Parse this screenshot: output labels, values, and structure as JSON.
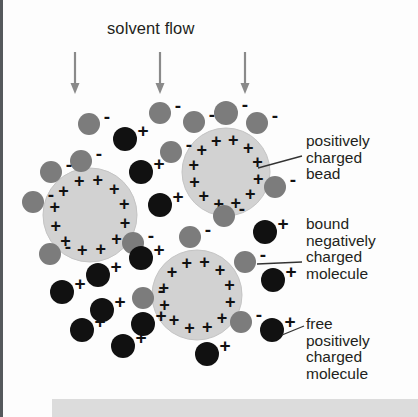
{
  "figure": {
    "type": "ion-exchange-chromatography-bead-diagram",
    "solvent_label": "solvent flow",
    "background_color": "#fdfdfd",
    "bottom_bar_color": "#dcdcdc",
    "left_rule_color": "#55595c"
  },
  "captions": {
    "bead": "positively\ncharged\nbead",
    "bound_molecule": "bound\nnegatively\ncharged\nmolecule",
    "free_molecule": "free\npositively\ncharged\nmolecule"
  },
  "legend_colors": {
    "bead_fill": "#d2d2d2",
    "bead_stroke": "#c4c4c4",
    "negative_particle": "#7c7c7c",
    "positive_particle": "#111111",
    "arrow": "#8a8a8a",
    "sign_color": "#111111",
    "leader_line": "#333333"
  },
  "arrows": [
    {
      "x": 75,
      "y1": 52,
      "y2": 92
    },
    {
      "x": 160,
      "y1": 52,
      "y2": 92
    },
    {
      "x": 245,
      "y1": 52,
      "y2": 92
    }
  ],
  "beads": [
    {
      "id": "bead-left",
      "cx": 90,
      "cy": 215,
      "r": 47,
      "charge": "+",
      "plus_count": 12
    },
    {
      "id": "bead-upper-right",
      "cx": 226,
      "cy": 172,
      "r": 44,
      "charge": "+",
      "plus_count": 12
    },
    {
      "id": "bead-lower-middle",
      "cx": 197,
      "cy": 295,
      "r": 45,
      "charge": "+",
      "plus_count": 12
    }
  ],
  "negative_particles": [
    {
      "cx": 89,
      "cy": 124,
      "r": 11,
      "sign": "-"
    },
    {
      "cx": 160,
      "cy": 113,
      "r": 11,
      "sign": "-"
    },
    {
      "cx": 194,
      "cy": 122,
      "r": 11,
      "sign": "-"
    },
    {
      "cx": 226,
      "cy": 113,
      "r": 12,
      "sign": "-"
    },
    {
      "cx": 257,
      "cy": 123,
      "r": 11,
      "sign": "-"
    },
    {
      "cx": 81,
      "cy": 161,
      "r": 11,
      "sign": "-"
    },
    {
      "cx": 51,
      "cy": 172,
      "r": 11,
      "sign": "-"
    },
    {
      "cx": 171,
      "cy": 152,
      "r": 11,
      "sign": "-"
    },
    {
      "cx": 33,
      "cy": 202,
      "r": 11,
      "sign": "-"
    },
    {
      "cx": 275,
      "cy": 187,
      "r": 11,
      "sign": "-"
    },
    {
      "cx": 224,
      "cy": 216,
      "r": 11,
      "sign": "-"
    },
    {
      "cx": 50,
      "cy": 254,
      "r": 11,
      "sign": "-"
    },
    {
      "cx": 133,
      "cy": 243,
      "r": 11,
      "sign": "-"
    },
    {
      "cx": 190,
      "cy": 237,
      "r": 11,
      "sign": "-"
    },
    {
      "cx": 245,
      "cy": 262,
      "r": 11,
      "sign": "-"
    },
    {
      "cx": 143,
      "cy": 298,
      "r": 11,
      "sign": "-"
    },
    {
      "cx": 241,
      "cy": 322,
      "r": 11,
      "sign": "-"
    }
  ],
  "positive_particles": [
    {
      "cx": 125,
      "cy": 139,
      "r": 12,
      "sign": "+"
    },
    {
      "cx": 141,
      "cy": 172,
      "r": 12,
      "sign": "+"
    },
    {
      "cx": 160,
      "cy": 205,
      "r": 12,
      "sign": "+"
    },
    {
      "cx": 265,
      "cy": 232,
      "r": 12,
      "sign": "+"
    },
    {
      "cx": 141,
      "cy": 258,
      "r": 12,
      "sign": "+"
    },
    {
      "cx": 98,
      "cy": 275,
      "r": 12,
      "sign": "+"
    },
    {
      "cx": 62,
      "cy": 292,
      "r": 12,
      "sign": "+"
    },
    {
      "cx": 273,
      "cy": 280,
      "r": 12,
      "sign": "+"
    },
    {
      "cx": 102,
      "cy": 310,
      "r": 12,
      "sign": "+"
    },
    {
      "cx": 143,
      "cy": 324,
      "r": 12,
      "sign": "+"
    },
    {
      "cx": 82,
      "cy": 330,
      "r": 12,
      "sign": "+"
    },
    {
      "cx": 123,
      "cy": 346,
      "r": 12,
      "sign": "+"
    },
    {
      "cx": 272,
      "cy": 330,
      "r": 12,
      "sign": "+"
    },
    {
      "cx": 207,
      "cy": 354,
      "r": 12,
      "sign": "+"
    }
  ],
  "leader_lines": [
    {
      "name": "bead-leader",
      "x1": 258,
      "y1": 168,
      "x2": 302,
      "y2": 156
    },
    {
      "name": "bound-molecule-leader",
      "x1": 257,
      "y1": 264,
      "x2": 302,
      "y2": 262
    },
    {
      "name": "free-molecule-leader",
      "x1": 282,
      "y1": 335,
      "x2": 304,
      "y2": 326
    }
  ]
}
